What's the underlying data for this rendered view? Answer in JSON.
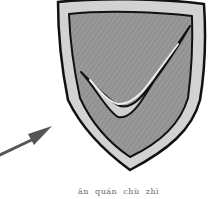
{
  "illustration": {
    "shield_icon": "shield-check-icon",
    "arrow_icon": "arrow-pointer-icon",
    "colors": {
      "outline": "#111111",
      "rim": "#cfcfcf",
      "fill": "#8f8f8f",
      "check_highlight": "#d8d8d8",
      "arrow": "#555555"
    }
  },
  "caption": {
    "text": "ān  quán  chù  zhì"
  }
}
